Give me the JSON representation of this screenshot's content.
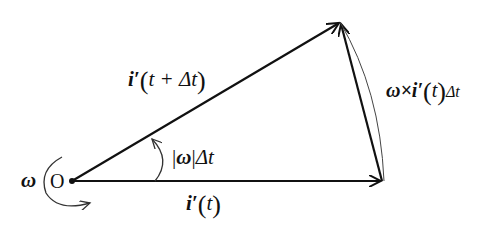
{
  "diagram": {
    "type": "vector-rotation",
    "colors": {
      "stroke": "#111111",
      "background": "#ffffff"
    },
    "origin": {
      "label": "O",
      "x": 72,
      "y": 181
    },
    "rotation_label": "ω",
    "vectors": [
      {
        "id": "i_prime_t",
        "from": [
          72,
          181
        ],
        "to": [
          382,
          181
        ],
        "label": {
          "base": "i′",
          "arg": "t"
        }
      },
      {
        "id": "i_prime_t_dt",
        "from": [
          72,
          181
        ],
        "to": [
          340,
          22
        ],
        "label": {
          "base": "i′",
          "arg": "t + Δt"
        }
      },
      {
        "id": "delta",
        "from": [
          382,
          181
        ],
        "to": [
          340,
          22
        ],
        "label": {
          "prefix": "ω×",
          "base": "i′",
          "arg": "t",
          "suffix": "Δt"
        }
      }
    ],
    "angle_label": {
      "bar": "|",
      "sym": "ω",
      "suffix": "Δt"
    }
  }
}
